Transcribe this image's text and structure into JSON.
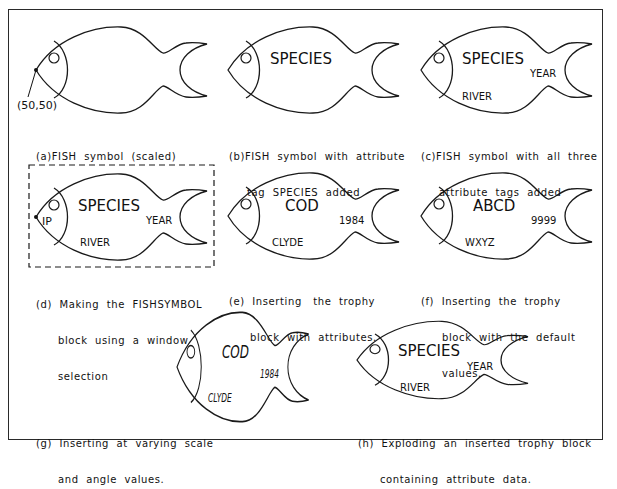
{
  "figure": {
    "panels": [
      {
        "id": "a",
        "caption_lines": [
          "(a)FISH  symbol  (scaled)"
        ],
        "point_label": "(50,50)",
        "attributes": []
      },
      {
        "id": "b",
        "caption_lines": [
          "(b)FISH  symbol  with  attribute",
          "tag  SPECIES  added"
        ],
        "attributes": [
          {
            "role": "species",
            "text": "SPECIES"
          }
        ]
      },
      {
        "id": "c",
        "caption_lines": [
          "(c)FISH  symbol  with  all  three",
          "attribute  tags  added"
        ],
        "attributes": [
          {
            "role": "species",
            "text": "SPECIES"
          },
          {
            "role": "year",
            "text": "YEAR"
          },
          {
            "role": "river",
            "text": "RIVER"
          }
        ]
      },
      {
        "id": "d",
        "caption_lines": [
          "(d)  Making  the  FISHSYMBOL",
          "block  using  a  window",
          "selection"
        ],
        "insertion_point_label": "IP",
        "attributes": [
          {
            "role": "species",
            "text": "SPECIES"
          },
          {
            "role": "year",
            "text": "YEAR"
          },
          {
            "role": "river",
            "text": "RIVER"
          }
        ]
      },
      {
        "id": "e",
        "caption_lines": [
          "(e)  Inserting   the  trophy",
          "block  with  attributes."
        ],
        "attributes": [
          {
            "role": "species",
            "text": "COD"
          },
          {
            "role": "year",
            "text": "1984"
          },
          {
            "role": "river",
            "text": "CLYDE"
          }
        ]
      },
      {
        "id": "f",
        "caption_lines": [
          "(f)  Inserting  the  trophy",
          "block  with  the  default",
          "values."
        ],
        "attributes": [
          {
            "role": "species",
            "text": "ABCD"
          },
          {
            "role": "year",
            "text": "9999"
          },
          {
            "role": "river",
            "text": "WXYZ"
          }
        ]
      },
      {
        "id": "g",
        "caption_lines": [
          "(g)  Inserting  at  varying  scale",
          "and  angle  values."
        ],
        "attributes": [
          {
            "role": "species",
            "text": "COD"
          },
          {
            "role": "year",
            "text": "1984"
          },
          {
            "role": "river",
            "text": "CLYDE"
          }
        ]
      },
      {
        "id": "h",
        "caption_lines": [
          "(h)  Exploding  an  inserted  trophy  block",
          "containing  attribute  data."
        ],
        "attributes": [
          {
            "role": "species",
            "text": "SPECIES"
          },
          {
            "role": "year",
            "text": "YEAR"
          },
          {
            "role": "river",
            "text": "RIVER"
          }
        ]
      }
    ],
    "colors": {
      "line": "#1a1a1a",
      "background": "#ffffff",
      "frame": "#2a2a2a"
    }
  }
}
